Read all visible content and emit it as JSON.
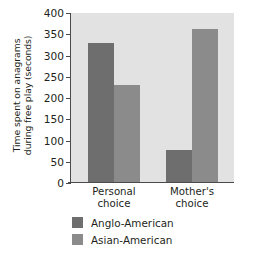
{
  "chart_data": {
    "type": "bar",
    "title": "",
    "subtitle": "",
    "xlabel": "",
    "ylabel_line1": "Time spent on anagrams",
    "ylabel_line2": "during free play (seconds)",
    "ylabel": "Time spent on anagrams during free play (seconds)",
    "categories": [
      "Personal choice",
      "Mother's choice"
    ],
    "category_lines": [
      {
        "l1": "Personal",
        "l2": "choice"
      },
      {
        "l1": "Mother's",
        "l2": "choice"
      }
    ],
    "series": [
      {
        "name": "Anglo-American",
        "values": [
          330,
          78
        ],
        "color": "#6e6e6e"
      },
      {
        "name": "Asian-American",
        "values": [
          230,
          363
        ],
        "color": "#8b8b8b"
      }
    ],
    "ylim": [
      0,
      400
    ],
    "yticks": [
      400,
      350,
      300,
      250,
      200,
      150,
      100,
      50,
      0
    ],
    "ytick_labels": [
      "400",
      "350",
      "300",
      "250",
      "200",
      "150",
      "100",
      "50",
      "0"
    ],
    "grid": false,
    "legend_position": "bottom",
    "plot_background": "#e2e2e2",
    "axis_color": "#4a4a4a"
  }
}
